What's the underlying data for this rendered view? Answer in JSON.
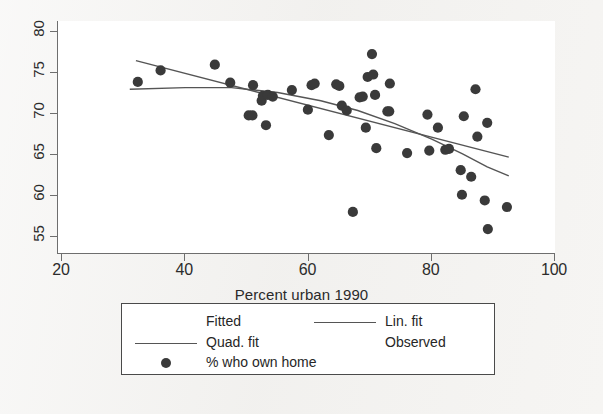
{
  "figure": {
    "background_color": "#f2f1ef",
    "plot_background_color": "#ffffff",
    "axis_color": "#6e6e6e",
    "marker_color": "#3a3a3a",
    "line_color": "#555555"
  },
  "axes": {
    "x_title": "Percent urban 1990",
    "x_ticks": [
      "20",
      "40",
      "60",
      "80",
      "100"
    ],
    "y_ticks": [
      "55",
      "60",
      "65",
      "70",
      "75",
      "80"
    ]
  },
  "legend": {
    "entries": [
      {
        "key": "none",
        "label": "Fitted",
        "column": "left",
        "row": 1
      },
      {
        "key": "line",
        "label": "Lin. fit",
        "column": "right",
        "row": 1
      },
      {
        "key": "line",
        "label": "Quad. fit",
        "column": "left",
        "row": 2
      },
      {
        "key": "none",
        "label": "Observed",
        "column": "right",
        "row": 2
      },
      {
        "key": "marker",
        "label": "% who own home",
        "column": "left",
        "row": 3
      }
    ]
  },
  "chart_data": {
    "type": "scatter",
    "title": "",
    "xlabel": "Percent urban 1990",
    "ylabel": "% who own home",
    "xlim": [
      20,
      100
    ],
    "ylim": [
      53,
      81
    ],
    "grid": false,
    "legend_position": "below-axes",
    "series": [
      {
        "name": "% who own home",
        "type": "scatter",
        "marker": "filled-circle",
        "color": "#3a3a3a",
        "points": [
          [
            32.3,
            73.8
          ],
          [
            36.0,
            75.2
          ],
          [
            44.8,
            75.9
          ],
          [
            47.3,
            73.7
          ],
          [
            50.3,
            69.7
          ],
          [
            50.9,
            69.7
          ],
          [
            51.0,
            73.4
          ],
          [
            52.4,
            71.5
          ],
          [
            52.6,
            72.1
          ],
          [
            53.1,
            68.5
          ],
          [
            53.4,
            72.2
          ],
          [
            54.2,
            72.0
          ],
          [
            57.3,
            72.8
          ],
          [
            59.9,
            70.4
          ],
          [
            60.5,
            73.4
          ],
          [
            61.0,
            73.6
          ],
          [
            63.3,
            67.3
          ],
          [
            64.5,
            73.5
          ],
          [
            65.0,
            73.3
          ],
          [
            65.4,
            70.9
          ],
          [
            66.2,
            70.3
          ],
          [
            67.2,
            57.9
          ],
          [
            68.3,
            71.9
          ],
          [
            68.8,
            72.0
          ],
          [
            69.3,
            68.2
          ],
          [
            69.6,
            74.4
          ],
          [
            70.3,
            77.2
          ],
          [
            70.5,
            74.7
          ],
          [
            70.8,
            72.2
          ],
          [
            71.0,
            65.7
          ],
          [
            72.8,
            70.2
          ],
          [
            73.1,
            70.2
          ],
          [
            73.2,
            73.6
          ],
          [
            76.0,
            65.1
          ],
          [
            79.3,
            69.8
          ],
          [
            79.6,
            65.4
          ],
          [
            81.0,
            68.2
          ],
          [
            82.2,
            65.5
          ],
          [
            82.8,
            65.6
          ],
          [
            84.7,
            63.0
          ],
          [
            84.9,
            60.0
          ],
          [
            85.2,
            69.6
          ],
          [
            86.4,
            62.2
          ],
          [
            87.1,
            72.9
          ],
          [
            87.4,
            67.1
          ],
          [
            88.6,
            59.3
          ],
          [
            89.0,
            68.8
          ],
          [
            89.1,
            55.8
          ],
          [
            92.2,
            58.5
          ]
        ]
      },
      {
        "name": "Lin. fit",
        "type": "line",
        "color": "#555555",
        "points": [
          [
            32.0,
            76.4
          ],
          [
            92.5,
            64.6
          ]
        ]
      },
      {
        "name": "Quad. fit",
        "type": "line",
        "color": "#555555",
        "points": [
          [
            31.0,
            72.9
          ],
          [
            40.0,
            73.1
          ],
          [
            47.5,
            73.1
          ],
          [
            55.0,
            72.5
          ],
          [
            62.0,
            71.5
          ],
          [
            68.0,
            70.3
          ],
          [
            74.0,
            68.7
          ],
          [
            80.0,
            66.8
          ],
          [
            85.0,
            65.0
          ],
          [
            89.0,
            63.4
          ],
          [
            92.5,
            62.3
          ]
        ]
      }
    ]
  }
}
